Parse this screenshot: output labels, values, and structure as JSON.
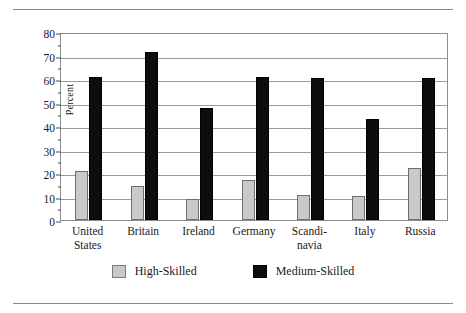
{
  "chart_data": {
    "type": "bar",
    "title": "",
    "xlabel": "",
    "ylabel": "Percent",
    "ylim": [
      0,
      80
    ],
    "ytick_step": 10,
    "yticks": [
      0,
      10,
      20,
      30,
      40,
      50,
      60,
      70,
      80
    ],
    "minor_tick_step": 5,
    "grid": true,
    "legend_position": "bottom",
    "categories": [
      "United\nStates",
      "Britain",
      "Ireland",
      "Germany",
      "Scandi-\nnavia",
      "Italy",
      "Russia"
    ],
    "series": [
      {
        "name": "High-Skilled",
        "color": "#c9c9c9",
        "values": [
          21,
          14.5,
          8.8,
          17,
          10.6,
          10.4,
          22
        ]
      },
      {
        "name": "Medium-Skilled",
        "color": "#0d0d0d",
        "values": [
          61,
          71.5,
          47.8,
          61,
          60.5,
          43,
          60.3
        ]
      }
    ]
  },
  "legend": {
    "items": [
      {
        "label": "High-Skilled",
        "swatch": "light-gray-square"
      },
      {
        "label": "Medium-Skilled",
        "swatch": "black-square"
      }
    ]
  },
  "rules": {
    "top": "top-horizontal-rule",
    "bottom": "bottom-horizontal-rule"
  }
}
